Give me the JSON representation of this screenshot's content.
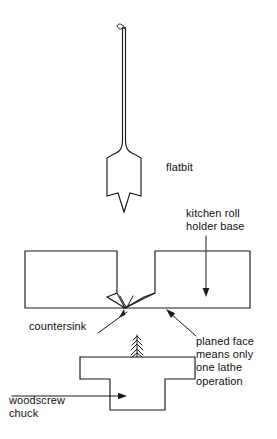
{
  "diagram": {
    "background_color": "#ffffff",
    "line_color": "#1a1a1a",
    "text_color": "#111111"
  },
  "labels": {
    "flatbit": "flatbit",
    "kitchen_roll_holder_base_line1": "kitchen roll",
    "kitchen_roll_holder_base_line2": "holder base",
    "countersink": "countersink",
    "planed_face_line1": "planed face",
    "planed_face_line2": "means only",
    "planed_face_line3": "one lathe",
    "planed_face_line4": "operation",
    "woodscrew_chuck_line1": "woodscrew",
    "woodscrew_chuck_line2": "chuck"
  },
  "parts": {
    "flatbit": {
      "name": "flatbit",
      "description": "spade drill bit with long shank, flared blade and centre point"
    },
    "kitchen_roll_holder_base": {
      "name": "kitchen roll holder base",
      "description": "rectangular base block shown in section with a central v-notch"
    },
    "countersink": {
      "name": "countersink",
      "description": "v-shaped recess in the underside of the base"
    },
    "woodscrew_chuck": {
      "name": "woodscrew chuck",
      "description": "T-shaped lathe chuck with protruding woodscrew"
    },
    "woodscrew": {
      "name": "woodscrew",
      "description": "threaded pointed screw projecting from the chuck face"
    }
  },
  "annotations": [
    {
      "target": "flatbit",
      "leader": "none"
    },
    {
      "target": "kitchen-roll-holder-base",
      "leader": "vertical-arrow-down"
    },
    {
      "target": "countersink",
      "leader": "diagonal-arrow-up-right"
    },
    {
      "target": "planed-face",
      "leader": "diagonal-arrow-up-left"
    },
    {
      "target": "woodscrew-chuck",
      "leader": "horizontal-arrow-right"
    }
  ]
}
